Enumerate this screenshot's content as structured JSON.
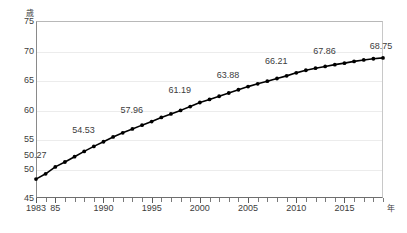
{
  "chart_data": {
    "type": "line",
    "title": "",
    "subtitle": "",
    "xlabel": "年",
    "ylabel": "歳",
    "y_unit_caption": "歳",
    "x_unit_caption": "年",
    "xlim": [
      1983,
      2019
    ],
    "ylim": [
      45,
      75
    ],
    "grid": true,
    "legend": null,
    "y_ticks": [
      75,
      70,
      65,
      60,
      55,
      50,
      45
    ],
    "x_ticks": [
      1983,
      1985,
      1990,
      1995,
      2000,
      2005,
      2010,
      2015
    ],
    "x_tick_labels": [
      "1983",
      "85",
      "1990",
      "1995",
      "2000",
      "2005",
      "2010",
      "2015"
    ],
    "x_minor_ticks_every": 1,
    "series": [
      {
        "name": "平均年齢",
        "marker": "filled-circle",
        "color": "#000000",
        "x": [
          1983,
          1984,
          1985,
          1986,
          1987,
          1988,
          1989,
          1990,
          1991,
          1992,
          1993,
          1994,
          1995,
          1996,
          1997,
          1998,
          1999,
          2000,
          2001,
          2002,
          2003,
          2004,
          2005,
          2006,
          2007,
          2008,
          2009,
          2010,
          2011,
          2012,
          2013,
          2014,
          2015,
          2016,
          2017,
          2018,
          2019
        ],
        "values": [
          48.2,
          49.1,
          50.27,
          51.1,
          52.0,
          52.9,
          53.75,
          54.53,
          55.35,
          56.05,
          56.7,
          57.35,
          57.96,
          58.65,
          59.25,
          59.85,
          60.5,
          61.19,
          61.7,
          62.25,
          62.8,
          63.35,
          63.88,
          64.35,
          64.8,
          65.25,
          65.7,
          66.21,
          66.65,
          67.0,
          67.3,
          67.6,
          67.86,
          68.15,
          68.4,
          68.6,
          68.75
        ]
      }
    ],
    "point_labels": [
      {
        "x": 1985,
        "value": "50.27"
      },
      {
        "x": 1990,
        "value": "54.53"
      },
      {
        "x": 1995,
        "value": "57.96"
      },
      {
        "x": 2000,
        "value": "61.19"
      },
      {
        "x": 2005,
        "value": "63.88"
      },
      {
        "x": 2010,
        "value": "66.21"
      },
      {
        "x": 2015,
        "value": "67.86"
      },
      {
        "x": 2019,
        "value": "68.75"
      }
    ],
    "colors": {
      "line": "#000000",
      "marker": "#000000",
      "grid": "#ececec",
      "axis": "#6e6e6e",
      "text": "#3c3c3c",
      "background": "#ffffff"
    }
  }
}
